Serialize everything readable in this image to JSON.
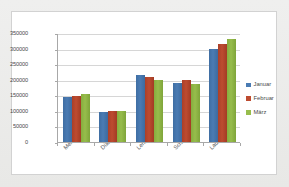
{
  "chart_data": {
    "type": "bar",
    "title": "",
    "subtitle": "",
    "xlabel": "",
    "ylabel": "",
    "categories": [
      "Meier",
      "Dübel",
      "Lehmann",
      "Schleicher",
      "Laubergruber"
    ],
    "series": [
      {
        "name": "Januar",
        "color": "#4a7bb3",
        "values": [
          145000,
          95000,
          214000,
          188000,
          299000
        ]
      },
      {
        "name": "Februar",
        "color": "#bd4b30",
        "values": [
          148000,
          99000,
          209000,
          199000,
          316000
        ]
      },
      {
        "name": "März",
        "color": "#97bd4c",
        "values": [
          155000,
          99000,
          200000,
          185000,
          332000
        ]
      }
    ],
    "ylim": [
      0,
      350000
    ],
    "yticks": [
      0,
      50000,
      100000,
      150000,
      200000,
      250000,
      300000,
      350000
    ],
    "ytick_labels": [
      "0",
      "50000",
      "100000",
      "150000",
      "200000",
      "250000",
      "300000",
      "350000"
    ],
    "grid": true,
    "grid_axis": "y",
    "legend_position": "right",
    "legend_entries": [
      "Januar",
      "Februar",
      "März"
    ],
    "annotations": []
  },
  "colors": {
    "widget_background": "#e9e9e7",
    "chart_background": "#ffffff",
    "chart_border": "#d2d2d2",
    "axis_line": "#a8a8a8",
    "gridline": "#d6d6d6",
    "tick_text": "#4a4a4a"
  }
}
